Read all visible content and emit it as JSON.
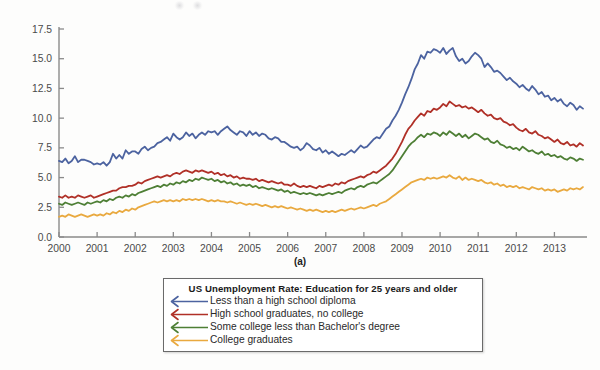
{
  "figure": {
    "caption": "(a)"
  },
  "legend": {
    "title": "US Unemployment Rate: Education for 25 years and older",
    "entries": [
      {
        "label": "Less than a high school diploma",
        "color": "#4c63a0"
      },
      {
        "label": "High school graduates, no college",
        "color": "#b03027"
      },
      {
        "label": "Some college less than Bachelor's degree",
        "color": "#4e7f35"
      },
      {
        "label": "College graduates",
        "color": "#e9a93f"
      }
    ]
  },
  "chart_data": {
    "type": "line",
    "title": "US Unemployment Rate: Education for 25 years and older",
    "xlabel": "",
    "ylabel": "",
    "xlim": [
      2000.0,
      2013.75
    ],
    "ylim": [
      0.0,
      17.5
    ],
    "grid": false,
    "legend_position": "below-center",
    "ytick_labels": [
      "0.0",
      "2.5",
      "5.0",
      "7.5",
      "10.0",
      "12.5",
      "15.0",
      "17.5"
    ],
    "yticks": [
      0.0,
      2.5,
      5.0,
      7.5,
      10.0,
      12.5,
      15.0,
      17.5
    ],
    "xtick_labels": [
      "2000",
      "2001",
      "2002",
      "2003",
      "2004",
      "2005",
      "2006",
      "2007",
      "2008",
      "2009",
      "2010",
      "2011",
      "2012",
      "2013"
    ],
    "xticks": [
      2000,
      2001,
      2002,
      2003,
      2004,
      2005,
      2006,
      2007,
      2008,
      2009,
      2010,
      2011,
      2012,
      2013
    ],
    "x_start": 2000.0,
    "x_step": 0.08333,
    "series": [
      {
        "name": "Less than a high school diploma",
        "color": "#4c63a0",
        "values": [
          6.4,
          6.3,
          6.6,
          6.2,
          6.4,
          6.8,
          6.3,
          6.5,
          6.5,
          6.4,
          6.3,
          6.1,
          6.2,
          6.1,
          6.3,
          6.0,
          6.3,
          7.0,
          6.6,
          6.9,
          6.6,
          7.3,
          7.0,
          7.2,
          7.2,
          7.0,
          7.4,
          7.6,
          7.3,
          7.5,
          7.6,
          7.9,
          8.0,
          8.2,
          8.4,
          8.1,
          8.7,
          8.4,
          8.2,
          8.4,
          8.8,
          8.5,
          8.7,
          8.3,
          8.6,
          8.8,
          8.6,
          8.9,
          8.8,
          8.9,
          8.6,
          8.9,
          9.1,
          9.3,
          9.0,
          8.8,
          8.6,
          8.9,
          8.8,
          8.5,
          8.9,
          8.6,
          8.8,
          8.5,
          8.7,
          8.6,
          8.3,
          8.2,
          8.4,
          8.3,
          8.0,
          8.0,
          7.8,
          7.6,
          7.5,
          7.6,
          7.3,
          7.5,
          7.9,
          7.7,
          7.4,
          7.3,
          7.5,
          7.1,
          7.3,
          7.0,
          7.2,
          7.0,
          6.8,
          7.0,
          6.9,
          7.1,
          7.3,
          7.1,
          7.4,
          7.7,
          7.5,
          7.6,
          7.9,
          8.2,
          8.4,
          8.3,
          8.7,
          9.1,
          9.3,
          9.8,
          10.2,
          10.7,
          11.3,
          12.0,
          12.6,
          13.3,
          14.1,
          14.6,
          15.3,
          15.0,
          15.6,
          15.5,
          15.8,
          15.7,
          15.5,
          15.9,
          15.4,
          15.7,
          15.9,
          15.2,
          14.8,
          15.0,
          14.6,
          14.8,
          15.2,
          15.5,
          15.3,
          15.0,
          14.3,
          14.6,
          14.3,
          13.9,
          14.0,
          13.8,
          13.5,
          13.2,
          13.4,
          13.1,
          12.9,
          12.6,
          12.8,
          12.5,
          12.3,
          12.7,
          12.4,
          12.0,
          12.2,
          11.8,
          11.9,
          11.5,
          11.7,
          11.4,
          11.6,
          11.2,
          11.0,
          11.3,
          11.1,
          10.7,
          11.0,
          10.8
        ]
      },
      {
        "name": "High school graduates, no college",
        "color": "#b03027",
        "values": [
          3.4,
          3.3,
          3.5,
          3.3,
          3.4,
          3.3,
          3.5,
          3.4,
          3.3,
          3.4,
          3.5,
          3.3,
          3.4,
          3.5,
          3.6,
          3.7,
          3.8,
          3.9,
          3.9,
          4.1,
          4.2,
          4.2,
          4.3,
          4.3,
          4.4,
          4.6,
          4.5,
          4.7,
          4.8,
          4.9,
          5.0,
          5.1,
          5.0,
          5.1,
          5.2,
          5.1,
          5.3,
          5.4,
          5.3,
          5.5,
          5.6,
          5.5,
          5.4,
          5.6,
          5.5,
          5.6,
          5.5,
          5.4,
          5.5,
          5.3,
          5.4,
          5.2,
          5.3,
          5.1,
          5.2,
          5.0,
          5.1,
          4.9,
          5.0,
          4.9,
          4.9,
          4.8,
          4.9,
          4.7,
          4.8,
          4.7,
          4.6,
          4.7,
          4.6,
          4.5,
          4.6,
          4.4,
          4.4,
          4.3,
          4.5,
          4.3,
          4.2,
          4.3,
          4.2,
          4.3,
          4.2,
          4.1,
          4.3,
          4.2,
          4.3,
          4.4,
          4.3,
          4.5,
          4.4,
          4.6,
          4.5,
          4.7,
          4.8,
          4.9,
          5.0,
          5.1,
          5.0,
          5.2,
          5.3,
          5.5,
          5.4,
          5.6,
          5.8,
          6.0,
          6.3,
          6.6,
          7.0,
          7.5,
          8.0,
          8.6,
          9.1,
          9.4,
          9.8,
          10.1,
          10.4,
          10.2,
          10.6,
          10.5,
          10.8,
          10.7,
          10.9,
          11.2,
          11.0,
          11.4,
          11.2,
          11.0,
          11.1,
          10.9,
          11.0,
          10.8,
          10.9,
          10.7,
          10.5,
          10.7,
          10.4,
          10.2,
          10.3,
          10.0,
          9.9,
          10.0,
          9.7,
          9.6,
          9.4,
          9.5,
          9.2,
          9.0,
          8.9,
          9.1,
          8.8,
          8.7,
          8.9,
          8.6,
          8.5,
          8.3,
          8.4,
          8.2,
          8.0,
          8.2,
          7.9,
          7.8,
          8.0,
          7.7,
          7.8,
          7.6,
          7.9,
          7.7
        ]
      },
      {
        "name": "Some college less than Bachelor's degree",
        "color": "#4e7f35",
        "values": [
          2.8,
          2.7,
          2.9,
          2.8,
          2.7,
          2.8,
          2.9,
          2.8,
          2.7,
          2.9,
          2.8,
          2.9,
          3.0,
          2.9,
          3.1,
          3.0,
          3.2,
          3.1,
          3.3,
          3.4,
          3.3,
          3.5,
          3.4,
          3.6,
          3.5,
          3.7,
          3.8,
          3.9,
          4.0,
          4.1,
          4.2,
          4.3,
          4.2,
          4.4,
          4.3,
          4.5,
          4.4,
          4.6,
          4.5,
          4.7,
          4.6,
          4.8,
          4.7,
          4.9,
          4.8,
          5.0,
          4.9,
          4.8,
          4.9,
          4.7,
          4.8,
          4.6,
          4.7,
          4.5,
          4.6,
          4.4,
          4.5,
          4.3,
          4.4,
          4.3,
          4.4,
          4.2,
          4.3,
          4.1,
          4.2,
          4.1,
          4.0,
          4.1,
          4.0,
          3.9,
          4.0,
          3.8,
          3.9,
          3.7,
          3.8,
          3.7,
          3.6,
          3.7,
          3.6,
          3.7,
          3.6,
          3.5,
          3.6,
          3.5,
          3.6,
          3.7,
          3.6,
          3.7,
          3.8,
          3.7,
          3.9,
          4.0,
          4.1,
          4.0,
          4.2,
          4.3,
          4.2,
          4.4,
          4.5,
          4.6,
          4.5,
          4.7,
          4.9,
          5.1,
          5.3,
          5.6,
          6.0,
          6.4,
          6.8,
          7.2,
          7.6,
          7.9,
          8.1,
          8.4,
          8.6,
          8.4,
          8.7,
          8.6,
          8.8,
          8.7,
          8.5,
          8.8,
          8.6,
          8.9,
          8.7,
          8.5,
          8.7,
          8.4,
          8.6,
          8.3,
          8.5,
          8.7,
          8.6,
          8.4,
          8.2,
          8.3,
          8.0,
          7.9,
          8.1,
          7.8,
          7.7,
          7.5,
          7.6,
          7.4,
          7.5,
          7.3,
          7.6,
          7.4,
          7.2,
          7.3,
          7.1,
          7.0,
          7.2,
          6.9,
          7.0,
          6.8,
          6.9,
          6.7,
          6.8,
          6.6,
          6.5,
          6.7,
          6.6,
          6.4,
          6.6,
          6.5
        ]
      },
      {
        "name": "College graduates",
        "color": "#e9a93f",
        "values": [
          1.7,
          1.8,
          1.7,
          1.9,
          1.8,
          1.7,
          1.8,
          1.9,
          1.8,
          1.7,
          1.8,
          1.9,
          1.8,
          1.9,
          1.8,
          2.0,
          1.9,
          2.1,
          2.0,
          2.2,
          2.1,
          2.3,
          2.2,
          2.4,
          2.3,
          2.5,
          2.6,
          2.7,
          2.8,
          2.9,
          3.0,
          2.9,
          3.0,
          3.1,
          3.0,
          3.1,
          3.0,
          3.1,
          3.0,
          3.2,
          3.1,
          3.2,
          3.1,
          3.2,
          3.1,
          3.2,
          3.1,
          3.0,
          3.1,
          3.0,
          3.1,
          3.0,
          3.0,
          2.9,
          3.0,
          2.9,
          2.8,
          2.9,
          2.8,
          2.7,
          2.8,
          2.7,
          2.8,
          2.7,
          2.6,
          2.7,
          2.6,
          2.5,
          2.6,
          2.5,
          2.6,
          2.5,
          2.4,
          2.5,
          2.4,
          2.3,
          2.4,
          2.3,
          2.2,
          2.3,
          2.2,
          2.3,
          2.2,
          2.1,
          2.2,
          2.1,
          2.2,
          2.1,
          2.2,
          2.3,
          2.2,
          2.3,
          2.4,
          2.3,
          2.4,
          2.5,
          2.4,
          2.5,
          2.6,
          2.7,
          2.6,
          2.8,
          2.9,
          3.0,
          3.2,
          3.4,
          3.6,
          3.8,
          4.0,
          4.2,
          4.4,
          4.6,
          4.7,
          4.8,
          4.9,
          4.8,
          5.0,
          4.9,
          5.0,
          4.9,
          5.0,
          5.1,
          5.0,
          5.2,
          5.0,
          4.9,
          5.1,
          4.8,
          5.0,
          4.8,
          4.9,
          4.8,
          4.7,
          4.8,
          4.6,
          4.5,
          4.6,
          4.4,
          4.5,
          4.3,
          4.4,
          4.2,
          4.3,
          4.2,
          4.3,
          4.1,
          4.2,
          4.1,
          4.0,
          4.2,
          4.1,
          4.0,
          4.1,
          3.9,
          4.0,
          3.9,
          4.0,
          3.8,
          3.9,
          4.0,
          3.9,
          4.1,
          4.0,
          4.1,
          4.0,
          4.2
        ]
      }
    ]
  }
}
